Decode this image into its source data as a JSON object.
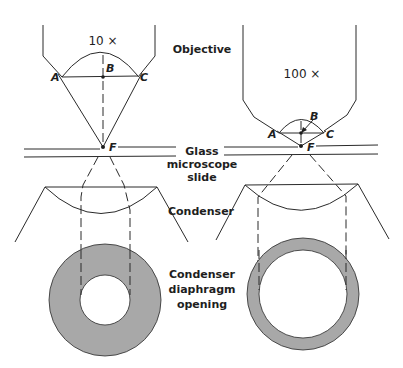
{
  "figure": {
    "type": "microscope numerical aperture comparison diagram",
    "colors": {
      "line": "#2a2a2a",
      "diaphragm_fill": "#a8a8a8",
      "background": "#ffffff"
    }
  },
  "labels": {
    "objective": "Objective",
    "slide_line1": "Glass",
    "slide_line2": "microscope",
    "slide_line3": "slide",
    "condenser": "Condenser",
    "diaphragm_line1": "Condenser",
    "diaphragm_line2": "diaphragm",
    "diaphragm_line3": "opening"
  },
  "left_panel": {
    "magnification": "10 ×",
    "points": {
      "a": "A",
      "b": "B",
      "c": "C",
      "f": "F"
    },
    "diaphragm": {
      "outer_radius": 56,
      "inner_radius": 25
    }
  },
  "right_panel": {
    "magnification": "100 ×",
    "points": {
      "a": "A",
      "b": "B",
      "c": "C",
      "f": "F"
    },
    "diaphragm": {
      "outer_radius": 56,
      "inner_radius": 44
    }
  }
}
